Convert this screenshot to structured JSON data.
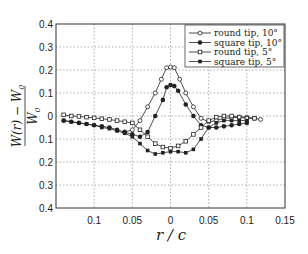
{
  "chart_data": {
    "type": "line",
    "title": "",
    "xlabel": "r / c",
    "ylabel": "(W(r) − W0) / W0",
    "ylabel_num": "W(r) − W",
    "ylabel_den": "W",
    "ylabel_sub": "0",
    "xlim": [
      -0.15,
      0.15
    ],
    "ylim": [
      -0.4,
      0.4
    ],
    "x_ticks": [
      -0.1,
      -0.05,
      0,
      0.05,
      0.1,
      0.15
    ],
    "x_tick_labels": [
      "0.1",
      "0.05",
      "0",
      "0.05",
      "0.1",
      "0.15"
    ],
    "y_ticks": [
      0.4,
      0.3,
      0.2,
      0.1,
      0,
      -0.1,
      -0.2,
      -0.3,
      -0.4
    ],
    "y_tick_labels": [
      "0.4",
      "0.3",
      "0.2",
      "0.1",
      "0",
      "0.1",
      "0.2",
      "0.3",
      "0.4"
    ],
    "grid": true,
    "legend_position": "upper right",
    "series": [
      {
        "name": "round tip, 10°",
        "marker": "open-circle",
        "x": [
          -0.005,
          0,
          0.005,
          0.012,
          0.02,
          0.03,
          0.04,
          0.05,
          0.06,
          0.07,
          0.08,
          0.09,
          0.1,
          0.11,
          0.118,
          -0.012,
          -0.02,
          -0.03,
          -0.04,
          -0.05,
          -0.06
        ],
        "y": [
          0.21,
          0.213,
          0.21,
          0.16,
          0.1,
          0.04,
          -0.01,
          -0.025,
          -0.02,
          -0.01,
          -0.008,
          -0.005,
          -0.005,
          -0.01,
          -0.015,
          0.16,
          0.1,
          0.04,
          -0.02,
          -0.06,
          -0.07
        ]
      },
      {
        "name": "square tip, 10°",
        "marker": "filled-circle",
        "x": [
          -0.14,
          -0.13,
          -0.12,
          -0.11,
          -0.1,
          -0.09,
          -0.08,
          -0.07,
          -0.06,
          -0.05,
          -0.04,
          -0.03,
          -0.02,
          -0.01,
          -0.005,
          0,
          0.005,
          0.01,
          0.02,
          0.03,
          0.04,
          0.05,
          0.06,
          0.07,
          0.08,
          0.09,
          0.1
        ],
        "y": [
          -0.02,
          -0.025,
          -0.03,
          -0.035,
          -0.04,
          -0.045,
          -0.05,
          -0.06,
          -0.07,
          -0.08,
          -0.09,
          -0.07,
          0.0,
          0.07,
          0.125,
          0.135,
          0.13,
          0.11,
          0.05,
          0.0,
          -0.04,
          -0.05,
          -0.05,
          -0.045,
          -0.04,
          -0.035,
          -0.03
        ]
      },
      {
        "name": "round tip, 5°",
        "marker": "open-square",
        "x": [
          -0.14,
          -0.13,
          -0.12,
          -0.11,
          -0.1,
          -0.09,
          -0.08,
          -0.07,
          -0.06,
          -0.05,
          -0.04,
          -0.03,
          -0.02,
          -0.01,
          0,
          0.01,
          0.02,
          0.03,
          0.04,
          0.05,
          0.06,
          0.07,
          0.08,
          0.09,
          0.1,
          0.11
        ],
        "y": [
          0.005,
          0.0,
          -0.002,
          -0.005,
          -0.008,
          -0.012,
          -0.015,
          -0.02,
          -0.025,
          -0.03,
          -0.06,
          -0.09,
          -0.12,
          -0.135,
          -0.14,
          -0.13,
          -0.11,
          -0.08,
          -0.05,
          -0.02,
          -0.005,
          0.0,
          0.0,
          -0.005,
          -0.01,
          -0.01
        ]
      },
      {
        "name": "square tip, 5°",
        "marker": "filled-square",
        "x": [
          -0.14,
          -0.13,
          -0.12,
          -0.11,
          -0.1,
          -0.09,
          -0.08,
          -0.07,
          -0.06,
          -0.05,
          -0.04,
          -0.03,
          -0.02,
          -0.01,
          0,
          0.01,
          0.02,
          0.03,
          0.04,
          0.05,
          0.06,
          0.07,
          0.08,
          0.09,
          0.1
        ],
        "y": [
          -0.02,
          -0.025,
          -0.03,
          -0.035,
          -0.04,
          -0.05,
          -0.055,
          -0.065,
          -0.075,
          -0.09,
          -0.12,
          -0.15,
          -0.165,
          -0.16,
          -0.155,
          -0.155,
          -0.16,
          -0.145,
          -0.1,
          -0.05,
          -0.03,
          -0.02,
          -0.02,
          -0.02,
          -0.02
        ]
      }
    ]
  },
  "legend": {
    "items": [
      {
        "label": "round tip, 10°",
        "marker": "open-circle"
      },
      {
        "label": "square tip, 10°",
        "marker": "filled-circle"
      },
      {
        "label": "round tip, 5°",
        "marker": "open-square"
      },
      {
        "label": "square tip, 5°",
        "marker": "filled-square"
      }
    ]
  },
  "colors": {
    "line": "#222222",
    "grid": "#9a9a9a",
    "frame": "#333333",
    "open_marker_fill": "#ffffff"
  }
}
